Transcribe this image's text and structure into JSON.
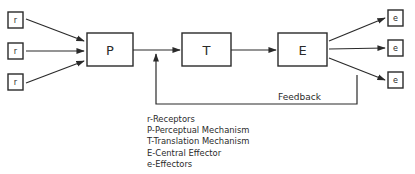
{
  "diagram": {
    "type": "block-diagram",
    "receptors": [
      {
        "label": "r"
      },
      {
        "label": "r"
      },
      {
        "label": "r"
      }
    ],
    "nodes": {
      "perceptual": {
        "label": "P"
      },
      "translation": {
        "label": "T"
      },
      "effector": {
        "label": "E"
      }
    },
    "effectors": [
      {
        "label": "e"
      },
      {
        "label": "e"
      },
      {
        "label": "e"
      }
    ],
    "feedback": {
      "label": "Feedback"
    },
    "edges": [
      {
        "from": "r1",
        "to": "P"
      },
      {
        "from": "r2",
        "to": "P"
      },
      {
        "from": "r3",
        "to": "P"
      },
      {
        "from": "P",
        "to": "T"
      },
      {
        "from": "T",
        "to": "E"
      },
      {
        "from": "E",
        "to": "e1"
      },
      {
        "from": "E",
        "to": "e2"
      },
      {
        "from": "E",
        "to": "e3"
      },
      {
        "from": "E",
        "to": "P-T line",
        "label": "Feedback"
      }
    ]
  },
  "legend": {
    "items": [
      "r-Receptors",
      "P-Perceptual Mechanism",
      "T-Translation Mechanism",
      "E-Central Effector",
      "e-Effectors"
    ]
  }
}
